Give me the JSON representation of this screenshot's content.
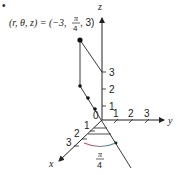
{
  "equation": {
    "lhs": "(r, θ, z) = (−3,",
    "frac_num": "π",
    "frac_den": "4",
    "rhs": ", 3)"
  },
  "axes": {
    "x_label": "x",
    "y_label": "y",
    "z_label": "z",
    "origin_label": "0",
    "x_ticks": [
      "1",
      "2",
      "3"
    ],
    "y_ticks": [
      "1",
      "2",
      "3"
    ],
    "z_ticks": [
      "1",
      "2",
      "3"
    ]
  },
  "angle": {
    "num": "π",
    "den": "4"
  },
  "colors": {
    "ink": "#222222",
    "arc_start": "#d0506a",
    "arc_end": "#2a9a9a"
  },
  "bullet": "•"
}
